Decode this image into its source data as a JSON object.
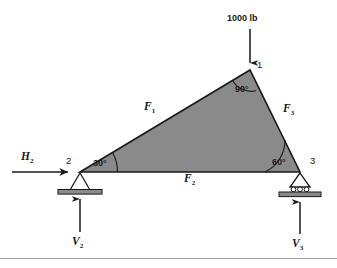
{
  "figure": {
    "background_color": "#ffffff",
    "member_fill_color": "#8a8a8a",
    "outline_color": "#1a1a1a",
    "rule_color": "#9a9aa0"
  },
  "applied_load": {
    "label": "1000 lb",
    "direction": "down",
    "applied_at_node": "1"
  },
  "nodes": [
    {
      "id": "node-1",
      "label": "1",
      "x": 250,
      "y": 70
    },
    {
      "id": "node-2",
      "label": "2",
      "x": 80,
      "y": 172
    },
    {
      "id": "node-3",
      "label": "3",
      "x": 300,
      "y": 172
    }
  ],
  "angles": [
    {
      "id": "angle-at-node-1",
      "label": "90°",
      "at_node": "1"
    },
    {
      "id": "angle-at-node-2",
      "label": "30°",
      "at_node": "2"
    },
    {
      "id": "angle-at-node-3",
      "label": "60°",
      "at_node": "3"
    }
  ],
  "members": [
    {
      "id": "member-f1",
      "symbol": "F",
      "subscript": "1",
      "between": "2-1"
    },
    {
      "id": "member-f2",
      "symbol": "F",
      "subscript": "2",
      "between": "2-3"
    },
    {
      "id": "member-f3",
      "symbol": "F",
      "subscript": "3",
      "between": "1-3"
    }
  ],
  "reactions": [
    {
      "id": "reaction-h2",
      "symbol": "H",
      "subscript": "2",
      "direction": "right",
      "at_node": "2"
    },
    {
      "id": "reaction-v2",
      "symbol": "V",
      "subscript": "2",
      "direction": "up",
      "at_node": "2"
    },
    {
      "id": "reaction-v3",
      "symbol": "V",
      "subscript": "3",
      "direction": "up",
      "at_node": "3"
    }
  ],
  "supports": [
    {
      "id": "support-node-2",
      "type": "pinned-support",
      "at_node": "2"
    },
    {
      "id": "support-node-3",
      "type": "roller-support",
      "at_node": "3"
    }
  ]
}
